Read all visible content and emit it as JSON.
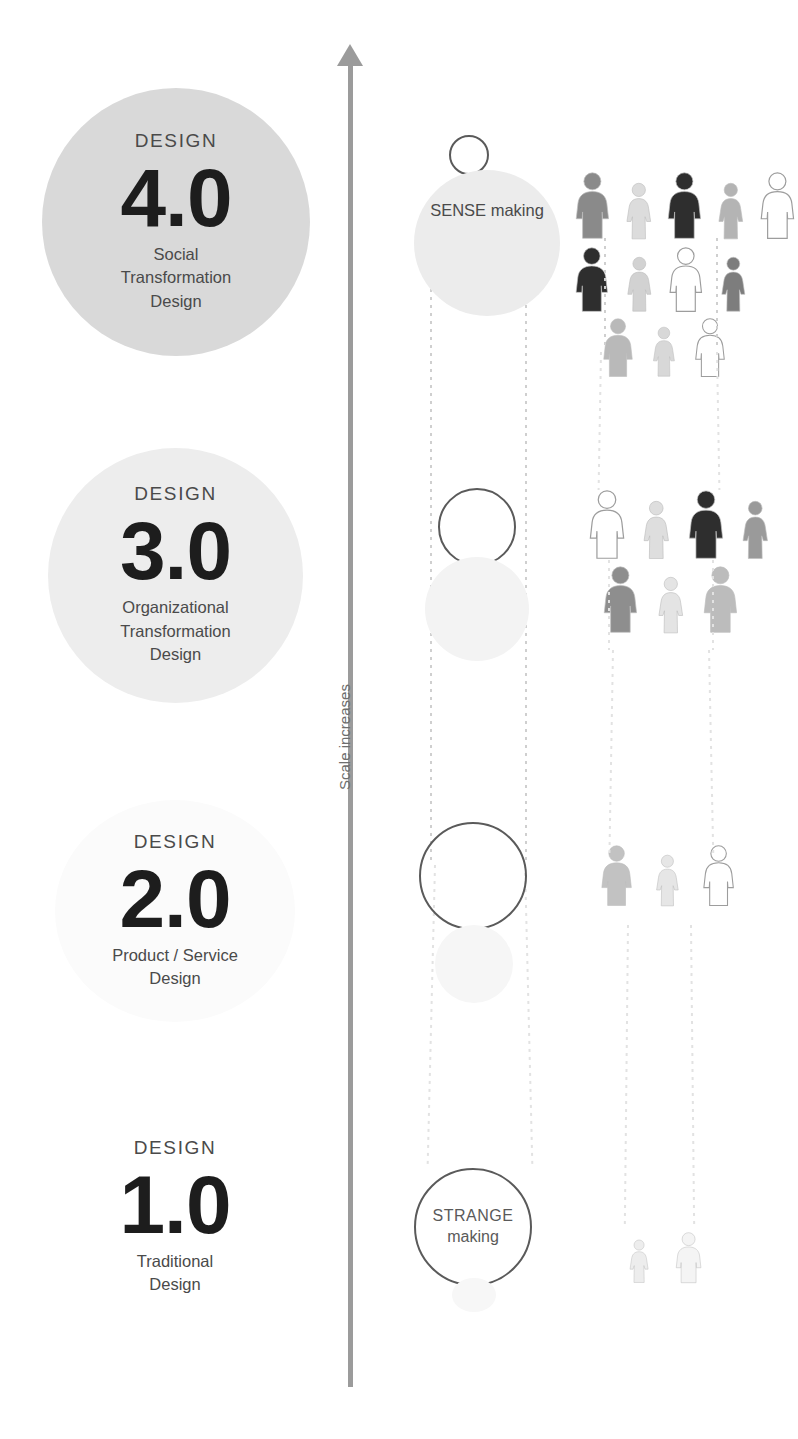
{
  "axis": {
    "label": "Scale increases",
    "arrow_icon": "up-arrow-icon",
    "color": "#9b9b9b"
  },
  "levels": [
    {
      "id": "design-4",
      "kicker": "DESIGN",
      "number": "4.0",
      "desc_lines": [
        "Social",
        "Transformation",
        "Design"
      ],
      "circle_color": "#d9d9d9"
    },
    {
      "id": "design-3",
      "kicker": "DESIGN",
      "number": "3.0",
      "desc_lines": [
        "Organizational",
        "Transformation",
        "Design"
      ],
      "circle_color": "#ededed"
    },
    {
      "id": "design-2",
      "kicker": "DESIGN",
      "number": "2.0",
      "desc_lines": [
        "Product / Service",
        "Design"
      ],
      "circle_color": "#fbfbfb"
    },
    {
      "id": "design-1",
      "kicker": "DESIGN",
      "number": "1.0",
      "desc_lines": [
        "Traditional",
        "Design"
      ],
      "circle_color": "#ffffff"
    }
  ],
  "making": {
    "sense": {
      "cap": "SENSE",
      "low": "making"
    },
    "strange": {
      "cap": "STRANGE",
      "low": "making"
    }
  },
  "chart_data": {
    "type": "diagram",
    "ylabel": "Scale increases",
    "categories": [
      "DESIGN 1.0",
      "DESIGN 2.0",
      "DESIGN 3.0",
      "DESIGN 4.0"
    ],
    "series": [
      {
        "name": "People involved",
        "values": [
          2,
          3,
          7,
          12
        ]
      },
      {
        "name": "Backdrop circle tone (0=white,1=grey)",
        "values": [
          0,
          0.05,
          0.45,
          0.85
        ]
      }
    ],
    "annotations": [
      "SENSE making",
      "STRANGE making"
    ],
    "legend": "none",
    "grid": false
  },
  "people_groups": [
    {
      "level": "design-4",
      "rows": [
        {
          "count": 5,
          "tones": [
            "#8a8a8a",
            "#dcdcdc",
            "#2e2e2e",
            "#b4b4b4",
            "#ffffff"
          ],
          "sexes": [
            "m",
            "f",
            "m",
            "f",
            "m"
          ]
        },
        {
          "count": 4,
          "tones": [
            "#2e2e2e",
            "#d2d2d2",
            "#ffffff",
            "#7d7d7d"
          ],
          "sexes": [
            "m",
            "f",
            "m",
            "f"
          ]
        },
        {
          "count": 3,
          "tones": [
            "#b9b9b9",
            "#d8d8d8",
            "#ffffff"
          ],
          "sexes": [
            "m",
            "f",
            "m"
          ]
        }
      ]
    },
    {
      "level": "design-3",
      "rows": [
        {
          "count": 4,
          "tones": [
            "#ffffff",
            "#dedede",
            "#2e2e2e",
            "#9a9a9a"
          ],
          "sexes": [
            "m",
            "f",
            "m",
            "f"
          ]
        },
        {
          "count": 3,
          "tones": [
            "#8e8e8e",
            "#e4e4e4",
            "#bcbcbc"
          ],
          "sexes": [
            "m",
            "f",
            "m"
          ]
        }
      ]
    },
    {
      "level": "design-2",
      "rows": [
        {
          "count": 3,
          "tones": [
            "#c2c2c2",
            "#e6e6e6",
            "#ffffff"
          ],
          "sexes": [
            "m",
            "f",
            "m"
          ]
        }
      ]
    },
    {
      "level": "design-1",
      "rows": [
        {
          "count": 2,
          "tones": [
            "#ededed",
            "#f4f4f4"
          ],
          "sexes": [
            "f",
            "m"
          ]
        }
      ]
    }
  ]
}
